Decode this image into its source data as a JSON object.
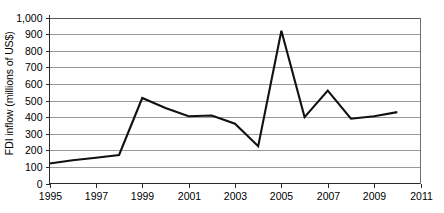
{
  "chart_data": {
    "type": "line",
    "title": "",
    "xlabel": "",
    "ylabel": "FDI inflow (millions of US$)",
    "x": [
      1995,
      1996,
      1997,
      1998,
      1999,
      2000,
      2001,
      2002,
      2003,
      2004,
      2005,
      2006,
      2007,
      2008,
      2009,
      2010
    ],
    "values": [
      120,
      140,
      155,
      172,
      515,
      455,
      405,
      410,
      360,
      225,
      920,
      400,
      560,
      390,
      405,
      430
    ],
    "series": [
      {
        "name": "FDI inflow",
        "values": [
          120,
          140,
          155,
          172,
          515,
          455,
          405,
          410,
          360,
          225,
          920,
          400,
          560,
          390,
          405,
          430
        ]
      }
    ],
    "xlim": [
      1995,
      2011
    ],
    "ylim": [
      0,
      1000
    ],
    "ytick_labels": [
      "1,000",
      "900",
      "800",
      "700",
      "600",
      "500",
      "400",
      "300",
      "200",
      "100",
      "0"
    ],
    "ytick_values": [
      1000,
      900,
      800,
      700,
      600,
      500,
      400,
      300,
      200,
      100,
      0
    ],
    "xtick_labels": [
      "1995",
      "1997",
      "1999",
      "2001",
      "2003",
      "2005",
      "2007",
      "2009",
      "2011"
    ],
    "xtick_values": [
      1995,
      1997,
      1999,
      2001,
      2003,
      2005,
      2007,
      2009,
      2011
    ],
    "grid": true,
    "legend": false,
    "line_color": "#111111",
    "grid_color": "#9a9a9a",
    "axis_color": "#2b2b2b",
    "background": "#ffffff"
  },
  "axis": {
    "y_title": "FDI inflow (millions of US$)",
    "y_ticks": [
      {
        "label": "1,000",
        "value": 1000
      },
      {
        "label": "900",
        "value": 900
      },
      {
        "label": "800",
        "value": 800
      },
      {
        "label": "700",
        "value": 700
      },
      {
        "label": "600",
        "value": 600
      },
      {
        "label": "500",
        "value": 500
      },
      {
        "label": "400",
        "value": 400
      },
      {
        "label": "300",
        "value": 300
      },
      {
        "label": "200",
        "value": 200
      },
      {
        "label": "100",
        "value": 100
      },
      {
        "label": "0",
        "value": 0
      }
    ],
    "x_ticks": [
      {
        "label": "1995",
        "value": 1995
      },
      {
        "label": "1997",
        "value": 1997
      },
      {
        "label": "1999",
        "value": 1999
      },
      {
        "label": "2001",
        "value": 2001
      },
      {
        "label": "2003",
        "value": 2003
      },
      {
        "label": "2005",
        "value": 2005
      },
      {
        "label": "2007",
        "value": 2007
      },
      {
        "label": "2009",
        "value": 2009
      },
      {
        "label": "2011",
        "value": 2011
      }
    ]
  }
}
